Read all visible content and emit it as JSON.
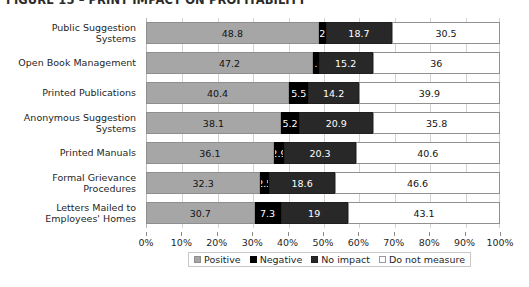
{
  "figure": {
    "title": "FIGURE 15 – PRINT IMPACT ON PROFITABILITY"
  },
  "chart_data": {
    "type": "bar",
    "orientation": "horizontal",
    "stacked": true,
    "stack_total": 100,
    "title": "FIGURE 15 – PRINT IMPACT ON PROFITABILITY",
    "xlabel": "",
    "ylabel": "",
    "xlim": [
      0,
      100
    ],
    "xtick_labels": [
      "0%",
      "10%",
      "20%",
      "30%",
      "40%",
      "50%",
      "60%",
      "70%",
      "80%",
      "90%",
      "100%"
    ],
    "xticks": [
      0,
      10,
      20,
      30,
      40,
      50,
      60,
      70,
      80,
      90,
      100
    ],
    "grid": true,
    "legend_position": "bottom",
    "categories": [
      "Public Suggestion Systems",
      "Open Book Management",
      "Printed Publications",
      "Anonymous Suggestion Systems",
      "Printed Manuals",
      "Formal Grievance Procedures",
      "Letters Mailed to Employees' Homes"
    ],
    "category_lines": [
      [
        "Public Suggestion",
        "Systems"
      ],
      [
        "Open Book Management"
      ],
      [
        "Printed Publications"
      ],
      [
        "Anonymous Suggestion",
        "Systems"
      ],
      [
        "Printed Manuals"
      ],
      [
        "Formal Grievance",
        "Procedures"
      ],
      [
        "Letters Mailed to",
        "Employees' Homes"
      ]
    ],
    "series": [
      {
        "name": "Positive",
        "color": "#a6a6a6",
        "values": [
          48.8,
          47.2,
          40.4,
          38.1,
          36.1,
          32.3,
          30.7
        ],
        "labels": [
          "48.8",
          "47.2",
          "40.4",
          "38.1",
          "36.1",
          "32.3",
          "30.7"
        ]
      },
      {
        "name": "Negative",
        "color": "#000000",
        "values": [
          2,
          1.6,
          5.5,
          5.2,
          2.9,
          2.5,
          7.3
        ],
        "labels": [
          "2",
          "1.6",
          "5.5",
          "5.2",
          "2.9",
          "2.5",
          "7.3"
        ]
      },
      {
        "name": "No impact",
        "color": "#282828",
        "values": [
          18.7,
          15.2,
          14.2,
          20.9,
          20.3,
          18.6,
          19
        ],
        "labels": [
          "18.7",
          "15.2",
          "14.2",
          "20.9",
          "20.3",
          "18.6",
          "19"
        ]
      },
      {
        "name": "Do not measure",
        "color": "#ffffff",
        "values": [
          30.5,
          36,
          39.9,
          35.8,
          40.6,
          46.6,
          43.1
        ],
        "labels": [
          "30.5",
          "36",
          "39.9",
          "35.8",
          "40.6",
          "46.6",
          "43.1"
        ]
      }
    ]
  },
  "legend": {
    "items": [
      {
        "label": "Positive",
        "swatch": "positive"
      },
      {
        "label": "Negative",
        "swatch": "negative"
      },
      {
        "label": "No impact",
        "swatch": "noimpact"
      },
      {
        "label": "Do not measure",
        "swatch": "donotmeasure"
      }
    ]
  }
}
